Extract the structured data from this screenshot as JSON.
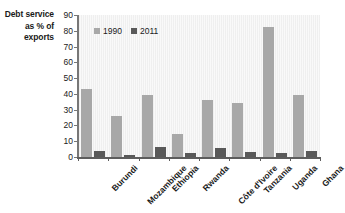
{
  "chart_data": {
    "type": "bar",
    "title": "",
    "subtitle": "",
    "ylabel": "Debt service as % of exports",
    "xlabel": "",
    "ylim": [
      0,
      90
    ],
    "yticks": [
      0,
      10,
      20,
      30,
      40,
      50,
      60,
      70,
      80,
      90
    ],
    "grid": false,
    "legend_position": "top-left inside plot",
    "categories": [
      "Burundi",
      "Mozambique",
      "Ethiopia",
      "Rwanda",
      "Côte d'Ivoire",
      "Tanzania",
      "Uganda",
      "Ghana"
    ],
    "series": [
      {
        "name": "1990",
        "color": "#a8a8a8",
        "values": [
          43,
          26,
          39.5,
          14.5,
          36,
          34,
          82.5,
          39.5
        ]
      },
      {
        "name": "2011",
        "color": "#595959",
        "values": [
          3.5,
          1.5,
          6.5,
          2.5,
          5.5,
          3,
          2.5,
          3.5
        ]
      }
    ]
  },
  "colors": {
    "series_1990": "#a8a8a8",
    "series_2011": "#595959",
    "plot_background": "#f2f2f2",
    "axis": "#5d5d5d",
    "text": "#1a1a1a",
    "page_background": "#ffffff"
  }
}
